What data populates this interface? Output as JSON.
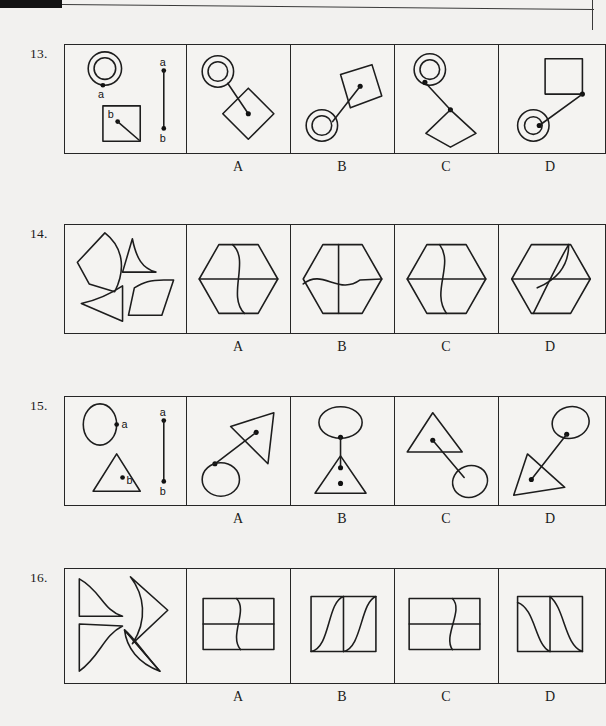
{
  "page": {
    "background_color": "#f2f1ef",
    "ink_color": "#1d1d1d"
  },
  "option_letters": [
    "A",
    "B",
    "C",
    "D"
  ],
  "questions": [
    {
      "number": "13.",
      "type": "rotation-linkage",
      "prompt_labels": [
        "a",
        "a",
        "b",
        "b"
      ],
      "prompt_description": "Concentric circles with point a on its lower edge; a square with point b inside connected by a short segment to the square's lower-right corner; a vertical reference segment from point a to point b.",
      "options": [
        {
          "letter": "A",
          "description": "Concentric circles upper-left joined by a line to a diamond, line ends at diamond centre."
        },
        {
          "letter": "B",
          "description": "Concentric circles lower-left joined by a line to a tilted square, line ends inside the tilted square."
        },
        {
          "letter": "C",
          "description": "Concentric circles upper-left joined by a line to a diamond, line ends at the diamond's top vertex."
        },
        {
          "letter": "D",
          "description": "Square upper-right joined by a line to concentric circles lower-left, line ends at the circle centre."
        }
      ]
    },
    {
      "number": "14.",
      "type": "assembly",
      "prompt_description": "Four separate pieces: a large quadrilateral with a convex curved right edge, a triangle with a concave curved left edge, a concave dart shape, and a parallelogram with a curved upper-left edge.",
      "options": [
        {
          "letter": "A",
          "description": "Hexagon divided by a horizontal line and an S-curve running top to bottom."
        },
        {
          "letter": "B",
          "description": "Hexagon divided by a vertical line and a wavy horizontal line."
        },
        {
          "letter": "C",
          "description": "Hexagon divided by a horizontal line and a vertical wavy line toward the left."
        },
        {
          "letter": "D",
          "description": "Hexagon divided by a horizontal line and an S-curve from top-right to bottom-left."
        }
      ]
    },
    {
      "number": "15.",
      "type": "rotation-linkage",
      "prompt_labels": [
        "a",
        "a",
        "b",
        "b"
      ],
      "prompt_description": "An ellipse with point a on its right edge; a triangle with point b inside; a vertical reference segment from point a to point b.",
      "options": [
        {
          "letter": "A",
          "description": "Ellipse at lower-left joined by a line to the interior of a triangle at upper-right."
        },
        {
          "letter": "B",
          "description": "Ellipse directly above a triangle, joined by a vertical line to the triangle's interior."
        },
        {
          "letter": "C",
          "description": "Triangle at upper-left joined by a line down to an ellipse at lower-right."
        },
        {
          "letter": "D",
          "description": "Ellipse at upper-right joined by a line down to the interior of a triangle at lower-left."
        }
      ]
    },
    {
      "number": "16.",
      "type": "assembly",
      "prompt_description": "Four arrow-like pieces with S-curved edges arranged pinwheel fashion.",
      "options": [
        {
          "letter": "A",
          "description": "Wide rectangle split by a horizontal line with an S-curve crossing it vertically near the centre."
        },
        {
          "letter": "B",
          "description": "Square split by a vertical line with an S-curve in each half."
        },
        {
          "letter": "C",
          "description": "Wide rectangle split by a horizontal line with an S-curve crossing it right of centre."
        },
        {
          "letter": "D",
          "description": "Square split by a vertical line with a concave curve in each half."
        }
      ]
    }
  ]
}
